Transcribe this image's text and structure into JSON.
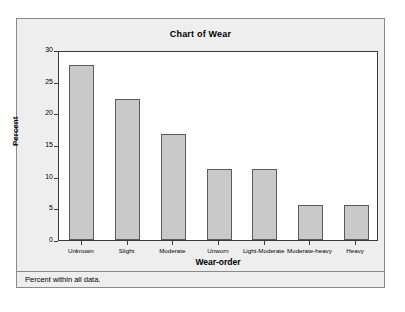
{
  "window": {
    "title": "Chart of Wear"
  },
  "footnote": "Percent within all data.",
  "axes": {
    "y_title": "Percent",
    "x_title": "Wear-order",
    "y_ticks": [
      "0",
      "5",
      "10",
      "15",
      "20",
      "25",
      "30"
    ]
  },
  "colors": {
    "bar_fill": "#c9c9c9",
    "bar_border": "#5b5b5b",
    "panel_background": "#eeeeee",
    "plot_background": "#ffffff",
    "frame_border": "#8a8a8a",
    "axis_line": "#3a3a3a",
    "text": "#000000"
  },
  "chart_data": {
    "type": "bar",
    "title": "Chart of Wear",
    "xlabel": "Wear-order",
    "ylabel": "Percent",
    "ylim": [
      0,
      30
    ],
    "yticks": [
      0,
      5,
      10,
      15,
      20,
      25,
      30
    ],
    "grid": false,
    "legend": null,
    "footnote": "Percent within all data.",
    "categories": [
      "Unknown",
      "Slight",
      "Moderate",
      "Unworn",
      "Light-Moderate",
      "Moderate-heavy",
      "Heavy"
    ],
    "values": [
      27.7,
      22.3,
      16.8,
      11.2,
      11.2,
      5.6,
      5.6
    ]
  }
}
